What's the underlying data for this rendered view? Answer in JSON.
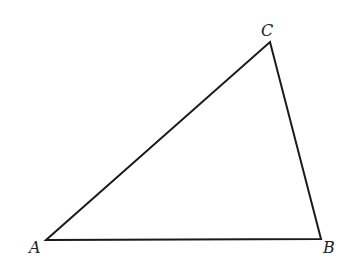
{
  "diagram": {
    "type": "triangle",
    "stroke_color": "#1a1a1a",
    "background": "#ffffff",
    "vertices": [
      {
        "name": "A",
        "label": "A",
        "x": 46,
        "y": 240
      },
      {
        "name": "B",
        "label": "B",
        "x": 321,
        "y": 239
      },
      {
        "name": "C",
        "label": "C",
        "x": 270,
        "y": 42
      }
    ],
    "edges": [
      "AB",
      "BC",
      "CA"
    ]
  }
}
